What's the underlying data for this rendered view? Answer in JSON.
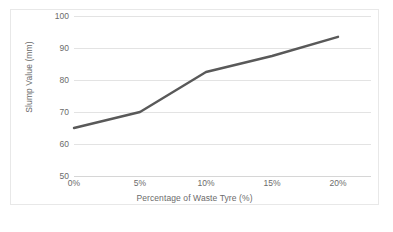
{
  "chart_data": {
    "type": "line",
    "title": "",
    "xlabel": "Percentage of Waste Tyre (%)",
    "ylabel": "Slump Value (mm)",
    "x": [
      0,
      5,
      10,
      15,
      20
    ],
    "xtick_labels": [
      "0%",
      "5%",
      "10%",
      "15%",
      "20%"
    ],
    "values": [
      65,
      70,
      82.5,
      87.5,
      93.5
    ],
    "ytick_labels": [
      "50",
      "60",
      "70",
      "80",
      "90",
      "100"
    ],
    "yticks": [
      50,
      60,
      70,
      80,
      90,
      100
    ],
    "ylim": [
      50,
      100
    ],
    "xlim": [
      0,
      22.5
    ],
    "grid": "horizontal",
    "legend": "none",
    "series": [
      {
        "name": "Slump Value",
        "values": [
          65,
          70,
          82.5,
          87.5,
          93.5
        ]
      }
    ],
    "line_color": "#595959",
    "line_width": 2.4,
    "markers": "none",
    "plot_background": "#ffffff",
    "gridline_color": "#e3e3e3",
    "tick_label_color": "#6b6b6b",
    "border_color": "#e8e8e8"
  }
}
